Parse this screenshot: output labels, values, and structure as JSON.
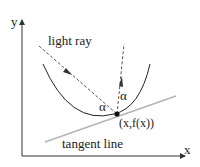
{
  "diagram": {
    "axes": {
      "x_label": "x",
      "y_label": "y"
    },
    "labels": {
      "light_ray": "light ray",
      "tangent_line": "tangent line",
      "point": "(x,f(x))",
      "angle_incident": "α",
      "angle_reflected": "α"
    },
    "colors": {
      "axis": "#333333",
      "curve": "#222222",
      "ray": "#444444",
      "tangent": "#b5b5b5",
      "point": "#111111"
    }
  }
}
